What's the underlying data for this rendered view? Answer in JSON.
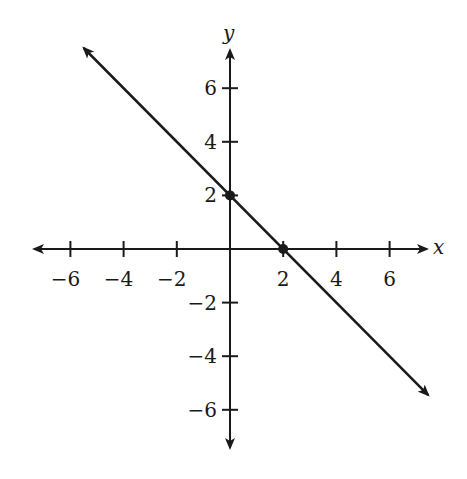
{
  "chart_data": {
    "type": "line",
    "title": "",
    "xlabel": "x",
    "ylabel": "y",
    "xlim": [
      -7.5,
      7.5
    ],
    "ylim": [
      -7.5,
      7.5
    ],
    "grid": false,
    "x_ticks": [
      -6,
      -4,
      -2,
      2,
      4,
      6
    ],
    "y_ticks": [
      -6,
      -4,
      -2,
      2,
      4,
      6
    ],
    "x_tick_labels": [
      "−6",
      "−4",
      "−2",
      "2",
      "4",
      "6"
    ],
    "y_tick_labels": [
      "−6",
      "−4",
      "−2",
      "2",
      "4",
      "6"
    ],
    "series": [
      {
        "name": "y = -x + 2",
        "slope": -1,
        "intercept": 2,
        "x": [
          -5.5,
          7.45
        ],
        "y": [
          7.5,
          -5.45
        ],
        "arrows_both_ends": true
      }
    ],
    "points": [
      {
        "x": 0,
        "y": 2,
        "label": "y-intercept"
      },
      {
        "x": 2,
        "y": 0,
        "label": "x-intercept"
      }
    ]
  },
  "colors": {
    "ink": "#1a1a1a",
    "background": "#ffffff"
  }
}
